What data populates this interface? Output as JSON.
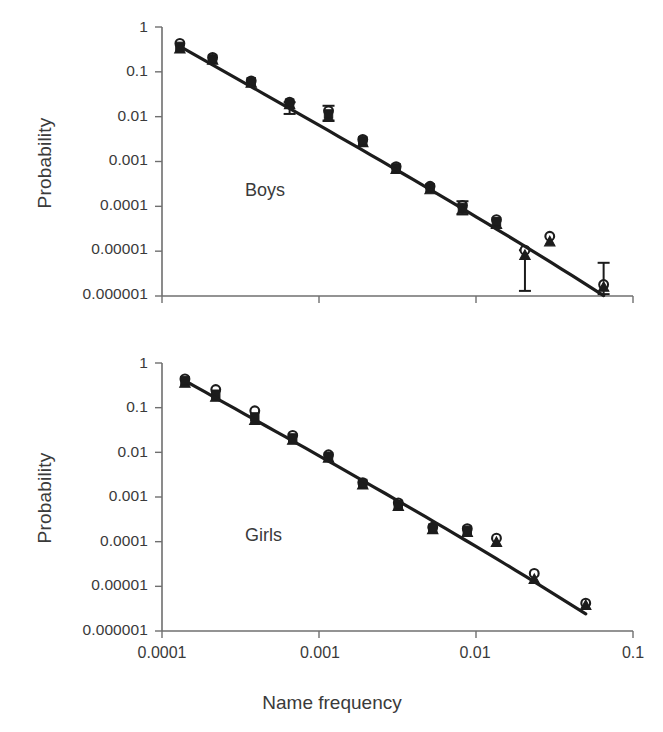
{
  "figure": {
    "xlabel": "Name frequency",
    "ylabel_top": "Probability",
    "ylabel_bottom": "Probability"
  },
  "chart_data": [
    {
      "type": "scatter",
      "title": "",
      "panel_label": "Boys",
      "xlabel": "Name frequency",
      "ylabel": "Probability",
      "xscale": "log",
      "yscale": "log",
      "xlim": [
        0.0001,
        0.1
      ],
      "ylim": [
        1e-06,
        1
      ],
      "xticks": [
        0.0001,
        0.001,
        0.01,
        0.1
      ],
      "xticklabels": [
        "0.0001",
        "0.001",
        "0.01",
        "0.1"
      ],
      "yticks": [
        1,
        0.1,
        0.01,
        0.001,
        0.0001,
        1e-05,
        1e-06
      ],
      "yticklabels": [
        "1",
        "0.1",
        "0.01",
        "0.001",
        "0.0001",
        "0.00001",
        "0.000001"
      ],
      "grid": false,
      "legend": "none",
      "series": [
        {
          "name": "open-circle",
          "marker": "open-circle",
          "x": [
            0.00013,
            0.00021,
            0.00037,
            0.00065,
            0.00115,
            0.0019,
            0.0031,
            0.0051,
            0.0082,
            0.0135,
            0.0205,
            0.0295,
            0.065
          ],
          "y": [
            0.43,
            0.21,
            0.063,
            0.021,
            0.0135,
            0.0031,
            0.00077,
            0.00028,
            0.000105,
            5.05e-05,
            1.05e-05,
            2.15e-05,
            1.8e-06
          ]
        },
        {
          "name": "filled-triangle",
          "marker": "filled-triangle",
          "x": [
            0.00013,
            0.00021,
            0.00037,
            0.00065,
            0.00115,
            0.0019,
            0.0031,
            0.0051,
            0.0082,
            0.0135,
            0.0205,
            0.0295,
            0.065
          ],
          "y": [
            0.33,
            0.185,
            0.057,
            0.019,
            0.0098,
            0.0027,
            0.00068,
            0.00024,
            8.6e-05,
            4.05e-05,
            8.2e-06,
            1.65e-05,
            1.6e-06
          ]
        },
        {
          "name": "filled-square",
          "marker": "filled-square",
          "x": [
            0.00013,
            0.00021,
            0.00037,
            0.00065,
            0.00115,
            0.0019,
            0.0031,
            0.0051,
            0.0082,
            0.0135
          ],
          "y": [
            0.37,
            0.195,
            0.06,
            0.02,
            0.0115,
            0.0029,
            0.00072,
            0.00026,
            9.5e-05,
            4.55e-05
          ]
        },
        {
          "name": "fit-line",
          "marker": "line",
          "x": [
            0.00013,
            0.065
          ],
          "y": [
            0.37,
            1.7e-06
          ]
        }
      ],
      "errorbars": [
        {
          "x": 0.00065,
          "y": 0.02,
          "lo": 0.0115,
          "hi": 0.021
        },
        {
          "x": 0.00115,
          "y": 0.0115,
          "lo": 0.0082,
          "hi": 0.0175
        },
        {
          "x": 0.0082,
          "y": 9.5e-05,
          "lo": 6.6e-05,
          "hi": 0.00013
        },
        {
          "x": 0.0205,
          "y": 9.2e-06,
          "lo": 1.3e-06,
          "hi": 1.05e-05
        },
        {
          "x": 0.065,
          "y": 1.7e-06,
          "lo": 1.1e-06,
          "hi": 5.5e-06
        }
      ]
    },
    {
      "type": "scatter",
      "title": "",
      "panel_label": "Girls",
      "xlabel": "Name frequency",
      "ylabel": "Probability",
      "xscale": "log",
      "yscale": "log",
      "xlim": [
        0.0001,
        0.1
      ],
      "ylim": [
        1e-06,
        1
      ],
      "xticks": [
        0.0001,
        0.001,
        0.01,
        0.1
      ],
      "xticklabels": [
        "0.0001",
        "0.001",
        "0.01",
        "0.1"
      ],
      "yticks": [
        1,
        0.1,
        0.01,
        0.001,
        0.0001,
        1e-05,
        1e-06
      ],
      "yticklabels": [
        "1",
        "0.1",
        "0.01",
        "0.001",
        "0.0001",
        "0.00001",
        "0.000001"
      ],
      "grid": false,
      "legend": "none",
      "series": [
        {
          "name": "open-circle",
          "marker": "open-circle",
          "x": [
            0.00014,
            0.00022,
            0.00039,
            0.00068,
            0.00115,
            0.0019,
            0.0032,
            0.0053,
            0.0088,
            0.0135,
            0.0235,
            0.05
          ],
          "y": [
            0.44,
            0.255,
            0.085,
            0.024,
            0.0088,
            0.0021,
            0.00074,
            0.00021,
            0.000195,
            0.00012,
            1.95e-05,
            4.2e-06
          ]
        },
        {
          "name": "filled-triangle",
          "marker": "filled-triangle",
          "x": [
            0.00014,
            0.00022,
            0.00039,
            0.00068,
            0.00115,
            0.0019,
            0.0032,
            0.0053,
            0.0088,
            0.0135,
            0.0235,
            0.05
          ],
          "y": [
            0.36,
            0.175,
            0.053,
            0.019,
            0.0076,
            0.0019,
            0.00063,
            0.00019,
            0.000165,
            9.8e-05,
            1.45e-05,
            3.8e-06
          ]
        },
        {
          "name": "filled-square",
          "marker": "filled-square",
          "x": [
            0.00014,
            0.00022,
            0.00039,
            0.00068,
            0.00115,
            0.0019,
            0.0032,
            0.0053,
            0.0088
          ],
          "y": [
            0.4,
            0.2,
            0.062,
            0.021,
            0.008,
            0.002,
            0.00068,
            0.0002,
            0.00018
          ]
        },
        {
          "name": "fit-line",
          "marker": "line",
          "x": [
            0.00014,
            0.05
          ],
          "y": [
            0.4,
            4e-06
          ]
        }
      ],
      "errorbars": []
    }
  ]
}
